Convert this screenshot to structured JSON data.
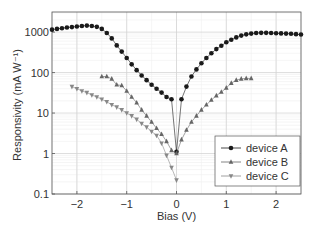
{
  "chart_data": {
    "type": "scatter",
    "title": "",
    "xlabel": "Bias (V)",
    "ylabel": "Responsivity (mA W⁻¹)",
    "xlim": [
      -2.5,
      2.5
    ],
    "ylim": [
      0.1,
      3000
    ],
    "yscale": "log",
    "grid": true,
    "legend_position": "lower right",
    "x_ticks": [
      "-2",
      "-1",
      "0",
      "1",
      "2"
    ],
    "y_ticks": [
      "0.1",
      "1",
      "10",
      "100",
      "1000"
    ],
    "series": [
      {
        "name": "device A",
        "marker": "circle",
        "color": "#1a1a1a",
        "x": [
          -2.5,
          -2.4,
          -2.3,
          -2.2,
          -2.1,
          -2.0,
          -1.9,
          -1.8,
          -1.7,
          -1.6,
          -1.5,
          -1.4,
          -1.3,
          -1.2,
          -1.1,
          -1.0,
          -0.9,
          -0.8,
          -0.7,
          -0.6,
          -0.5,
          -0.4,
          -0.3,
          -0.2,
          -0.1,
          0.0,
          0.1,
          0.2,
          0.3,
          0.4,
          0.5,
          0.6,
          0.7,
          0.8,
          0.9,
          1.0,
          1.1,
          1.2,
          1.3,
          1.4,
          1.5,
          1.6,
          1.7,
          1.8,
          1.9,
          2.0,
          2.1,
          2.2,
          2.3,
          2.4,
          2.5
        ],
        "y": [
          1150,
          1200,
          1250,
          1300,
          1330,
          1380,
          1420,
          1450,
          1420,
          1350,
          1200,
          950,
          700,
          470,
          330,
          230,
          160,
          115,
          85,
          65,
          50,
          40,
          32,
          25,
          22,
          1.1,
          22,
          45,
          80,
          120,
          170,
          230,
          300,
          380,
          460,
          560,
          650,
          740,
          820,
          880,
          920,
          950,
          960,
          960,
          950,
          940,
          930,
          920,
          910,
          890,
          870
        ]
      },
      {
        "name": "device B",
        "marker": "triangle-up",
        "color": "#666666",
        "x": [
          -1.5,
          -1.4,
          -1.3,
          -1.2,
          -1.1,
          -1.0,
          -0.9,
          -0.8,
          -0.7,
          -0.6,
          -0.5,
          -0.4,
          -0.3,
          -0.2,
          -0.1,
          0.0,
          0.1,
          0.2,
          0.3,
          0.4,
          0.5,
          0.6,
          0.7,
          0.8,
          0.9,
          1.0,
          1.1,
          1.2,
          1.3,
          1.4,
          1.5
        ],
        "y": [
          80,
          80,
          70,
          50,
          48,
          35,
          25,
          18,
          12,
          8.5,
          6,
          4.2,
          3,
          2,
          1.2,
          1.0,
          2.2,
          3.8,
          6,
          8.5,
          12,
          16,
          21,
          27,
          33,
          42,
          55,
          65,
          70,
          72,
          72
        ]
      },
      {
        "name": "device C",
        "marker": "triangle-down",
        "color": "#888888",
        "x": [
          -2.1,
          -2.0,
          -1.9,
          -1.8,
          -1.7,
          -1.6,
          -1.5,
          -1.4,
          -1.3,
          -1.2,
          -1.1,
          -1.0,
          -0.9,
          -0.8,
          -0.7,
          -0.6,
          -0.5,
          -0.4,
          -0.3,
          -0.2,
          -0.1,
          0.0
        ],
        "y": [
          45,
          40,
          35,
          32,
          28,
          25,
          22,
          19,
          16,
          14,
          12,
          10,
          8.5,
          7,
          5.5,
          4.5,
          3.5,
          2.8,
          1.8,
          0.9,
          0.45,
          0.22
        ]
      }
    ]
  }
}
